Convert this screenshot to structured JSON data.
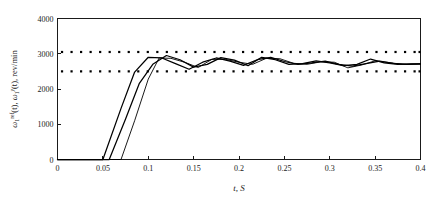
{
  "chart_data": {
    "type": "line",
    "title": "",
    "xlabel": "t, S",
    "ylabel": "ω₁ʳᵉᶠ(t), ω₁ʸ(t), rev/min",
    "ylabel_parts": {
      "omega": "ω",
      "sub1": "1",
      "sup_ref": "ref",
      "sup_y": "y",
      "mid_text": "(t), ",
      "tail_text": "(t), rev/min"
    },
    "xlim": [
      0,
      0.4
    ],
    "ylim": [
      0,
      4000
    ],
    "xticks": [
      0,
      0.05,
      0.1,
      0.15,
      0.2,
      0.25,
      0.3,
      0.35,
      0.4
    ],
    "xtick_labels": [
      "0",
      "0.05",
      "0.1",
      "0.15",
      "0.2",
      "0.25",
      "0.3",
      "0.35",
      "0.4"
    ],
    "yticks": [
      0,
      1000,
      2000,
      3000,
      4000
    ],
    "ytick_labels": [
      "0",
      "1000",
      "2000",
      "3000",
      "4000"
    ],
    "grid": false,
    "legend": "none",
    "line_color": "#000000",
    "reference_dot_color": "#000000",
    "background_color": "#ffffff",
    "axis_color": "#1a1a1a",
    "series": [
      {
        "name": "reference-band-upper",
        "style": "dotted",
        "value": 3050,
        "x": [
          0.005,
          0.0155,
          0.026,
          0.0365,
          0.047,
          0.0575,
          0.068,
          0.0785,
          0.089,
          0.0995,
          0.11,
          0.1205,
          0.131,
          0.1415,
          0.152,
          0.1625,
          0.173,
          0.1835,
          0.194,
          0.2045,
          0.215,
          0.2255,
          0.236,
          0.2465,
          0.257,
          0.2675,
          0.278,
          0.2885,
          0.299,
          0.3095,
          0.32,
          0.3305,
          0.341,
          0.3515,
          0.362,
          0.3725,
          0.383,
          0.3935,
          0.399
        ],
        "values": [
          3050,
          3050,
          3050,
          3050,
          3050,
          3050,
          3050,
          3050,
          3050,
          3050,
          3050,
          3050,
          3050,
          3050,
          3050,
          3050,
          3050,
          3050,
          3050,
          3050,
          3050,
          3050,
          3050,
          3050,
          3050,
          3050,
          3050,
          3050,
          3050,
          3050,
          3050,
          3050,
          3050,
          3050,
          3050,
          3050,
          3050,
          3050,
          3050
        ]
      },
      {
        "name": "reference-band-lower",
        "style": "dotted",
        "value": 2500,
        "x": [
          0.005,
          0.0155,
          0.026,
          0.0365,
          0.047,
          0.0575,
          0.068,
          0.0785,
          0.089,
          0.0995,
          0.11,
          0.1205,
          0.131,
          0.1415,
          0.152,
          0.1625,
          0.173,
          0.1835,
          0.194,
          0.2045,
          0.215,
          0.2255,
          0.236,
          0.2465,
          0.257,
          0.2675,
          0.278,
          0.2885,
          0.299,
          0.3095,
          0.32,
          0.3305,
          0.341,
          0.3515,
          0.362,
          0.3725,
          0.383,
          0.3935,
          0.399
        ],
        "values": [
          2500,
          2500,
          2500,
          2500,
          2500,
          2500,
          2500,
          2500,
          2500,
          2500,
          2500,
          2500,
          2500,
          2500,
          2500,
          2500,
          2500,
          2500,
          2500,
          2500,
          2500,
          2500,
          2500,
          2500,
          2500,
          2500,
          2500,
          2500,
          2500,
          2500,
          2500,
          2500,
          2500,
          2500,
          2500,
          2500,
          2500,
          2500,
          2500
        ]
      },
      {
        "name": "response-curve-1",
        "style": "solid",
        "x": [
          0,
          0.05,
          0.07,
          0.085,
          0.1,
          0.115,
          0.13,
          0.145,
          0.16,
          0.175,
          0.19,
          0.205,
          0.22,
          0.235,
          0.25,
          0.265,
          0.28,
          0.295,
          0.31,
          0.325,
          0.34,
          0.355,
          0.37,
          0.385,
          0.4
        ],
        "values": [
          0,
          0,
          1450,
          2480,
          2900,
          2880,
          2720,
          2560,
          2760,
          2880,
          2790,
          2670,
          2830,
          2900,
          2780,
          2700,
          2740,
          2790,
          2700,
          2650,
          2720,
          2790,
          2730,
          2700,
          2710
        ]
      },
      {
        "name": "response-curve-2",
        "style": "solid",
        "x": [
          0,
          0.057,
          0.075,
          0.09,
          0.105,
          0.12,
          0.135,
          0.15,
          0.165,
          0.18,
          0.195,
          0.21,
          0.225,
          0.24,
          0.255,
          0.27,
          0.285,
          0.3,
          0.315,
          0.33,
          0.345,
          0.36,
          0.375,
          0.39,
          0.4
        ],
        "values": [
          0,
          0,
          1150,
          2150,
          2700,
          2950,
          2830,
          2620,
          2700,
          2890,
          2820,
          2660,
          2900,
          2830,
          2700,
          2720,
          2800,
          2740,
          2660,
          2700,
          2850,
          2740,
          2700,
          2710,
          2710
        ]
      },
      {
        "name": "response-curve-3",
        "style": "solid-thin",
        "x": [
          0,
          0.07,
          0.085,
          0.1,
          0.112,
          0.125,
          0.14,
          0.155,
          0.17,
          0.185,
          0.2,
          0.215,
          0.23,
          0.245,
          0.26,
          0.275,
          0.29,
          0.305,
          0.32,
          0.335,
          0.35,
          0.365,
          0.38,
          0.395,
          0.4
        ],
        "values": [
          0,
          0,
          1100,
          2280,
          2880,
          2870,
          2760,
          2610,
          2840,
          2840,
          2760,
          2700,
          2870,
          2860,
          2730,
          2700,
          2770,
          2760,
          2600,
          2680,
          2800,
          2750,
          2700,
          2705,
          2710
        ]
      }
    ]
  }
}
